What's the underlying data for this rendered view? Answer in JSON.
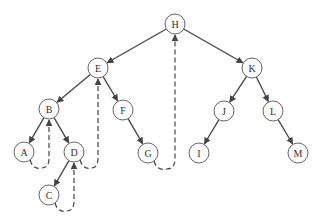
{
  "diagram": {
    "type": "threaded-binary-tree",
    "colors": {
      "stroke": "#444444",
      "node_border": "#555555",
      "node_fill": "#ffffff",
      "text": "#333333"
    },
    "node_radius": 10,
    "nodes": [
      {
        "id": "H",
        "label": "H",
        "x": 175,
        "y": 24
      },
      {
        "id": "E",
        "label": "E",
        "x": 98,
        "y": 68
      },
      {
        "id": "K",
        "label": "K",
        "x": 252,
        "y": 68
      },
      {
        "id": "B",
        "label": "B",
        "x": 49,
        "y": 109
      },
      {
        "id": "F",
        "label": "F",
        "x": 123,
        "y": 110
      },
      {
        "id": "J",
        "label": "J",
        "x": 224,
        "y": 111
      },
      {
        "id": "L",
        "label": "L",
        "x": 273,
        "y": 111
      },
      {
        "id": "A",
        "label": "A",
        "x": 24,
        "y": 152
      },
      {
        "id": "D",
        "label": "D",
        "x": 74,
        "y": 152
      },
      {
        "id": "G",
        "label": "G",
        "x": 148,
        "y": 153
      },
      {
        "id": "I",
        "label": "I",
        "x": 199,
        "y": 153
      },
      {
        "id": "M",
        "label": "M",
        "x": 298,
        "y": 153
      },
      {
        "id": "C",
        "label": "C",
        "x": 49,
        "y": 195
      }
    ],
    "edges": [
      {
        "from": "H",
        "to": "E"
      },
      {
        "from": "H",
        "to": "K"
      },
      {
        "from": "E",
        "to": "B"
      },
      {
        "from": "E",
        "to": "F"
      },
      {
        "from": "B",
        "to": "A"
      },
      {
        "from": "B",
        "to": "D"
      },
      {
        "from": "D",
        "to": "C"
      },
      {
        "from": "F",
        "to": "G"
      },
      {
        "from": "K",
        "to": "J"
      },
      {
        "from": "K",
        "to": "L"
      },
      {
        "from": "J",
        "to": "I"
      },
      {
        "from": "L",
        "to": "M"
      }
    ],
    "threads": [
      {
        "from": "A",
        "to": "B",
        "style": "dashed"
      },
      {
        "from": "C",
        "to": "D",
        "style": "dashed"
      },
      {
        "from": "D",
        "to": "E",
        "style": "dashed"
      },
      {
        "from": "G",
        "to": "H",
        "style": "dashed"
      }
    ]
  }
}
